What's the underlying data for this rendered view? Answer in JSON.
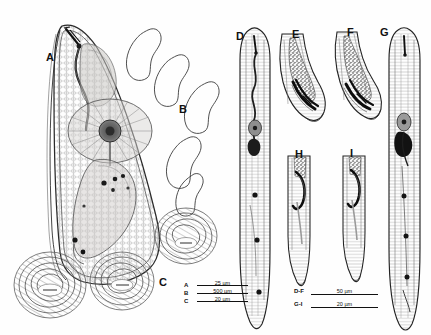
{
  "figure": {
    "domain": "scientific-illustration",
    "background_color": "#fefefe",
    "ink_color": "#1a1a1a",
    "panel_count": 9
  },
  "panels": [
    {
      "id": "A",
      "label": "A",
      "description": "anterior region of female showing stylet, procorpus, median bulb and glandular oesophagus within swollen body",
      "x": 46,
      "y": 52
    },
    {
      "id": "B",
      "label": "B",
      "description": "five pear-shaped (teardrop) body outlines of swollen females",
      "x": 179,
      "y": 104
    },
    {
      "id": "C",
      "label": "C",
      "description": "three coiled juvenile/egg-mass structures in surface view",
      "x": 159,
      "y": 277
    },
    {
      "id": "D",
      "label": "D",
      "description": "whole male anterior to tail, lateral view",
      "x": 236,
      "y": 31
    },
    {
      "id": "E",
      "label": "E",
      "description": "male tail with spicules and gubernaculum, lateral view",
      "x": 292,
      "y": 29
    },
    {
      "id": "F",
      "label": "F",
      "description": "male tail with spicules, alternate specimen",
      "x": 347,
      "y": 27
    },
    {
      "id": "G",
      "label": "G",
      "description": "whole juvenile, lateral view with stylet and oesophageal glands",
      "x": 380,
      "y": 27
    },
    {
      "id": "H",
      "label": "H",
      "description": "juvenile tail terminus, lateral view",
      "x": 295,
      "y": 149
    },
    {
      "id": "I",
      "label": "I",
      "description": "juvenile tail terminus, alternate specimen",
      "x": 350,
      "y": 148
    }
  ],
  "legends": [
    {
      "id": "legend-abc",
      "rows": [
        {
          "key": "A",
          "value": "25 µm"
        },
        {
          "key": "B",
          "value": "500 µm"
        },
        {
          "key": "C",
          "value": "20 µm"
        }
      ]
    },
    {
      "id": "legend-dfgi",
      "rows": [
        {
          "key": "D-F",
          "value": "50 µm"
        },
        {
          "key": "G-I",
          "value": "20 µm"
        }
      ]
    }
  ]
}
